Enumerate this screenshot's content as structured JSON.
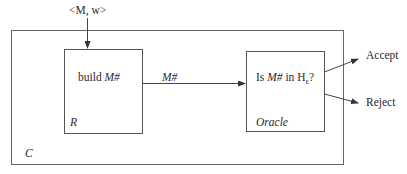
{
  "diagram": {
    "type": "reduction-block-diagram",
    "input_label": "<M, w>",
    "outer_box": {
      "label": "C"
    },
    "reducer_box": {
      "label": "R",
      "text_prefix": "build ",
      "text_var": "M#"
    },
    "edge_label": "M#",
    "oracle_box": {
      "label": "Oracle",
      "text_prefix": "Is ",
      "text_var": "M#",
      "text_mid": " in H",
      "text_sub": "ε",
      "text_suffix": "?"
    },
    "outputs": {
      "accept": "Accept",
      "reject": "Reject"
    },
    "colors": {
      "line": "#555555",
      "text": "#2a2a2a",
      "background": "#ffffff"
    }
  }
}
